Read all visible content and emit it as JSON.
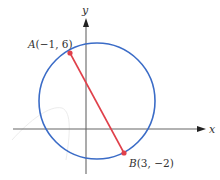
{
  "diagram": {
    "type": "coordinate-geometry",
    "axes": {
      "x_label": "x",
      "y_label": "y",
      "color": "#555555"
    },
    "circle": {
      "color": "#3b6cc7",
      "diameter_endpoints": [
        "A",
        "B"
      ]
    },
    "segment": {
      "from": "A",
      "to": "B",
      "color": "#e0404a"
    },
    "points": [
      {
        "name": "A",
        "x": -1,
        "y": 6,
        "label": "A(−1, 6)",
        "color": "#e0404a"
      },
      {
        "name": "B",
        "x": 3,
        "y": -2,
        "label": "B(3, −2)",
        "color": "#e0404a"
      }
    ]
  },
  "labels": {
    "x_axis": "x",
    "y_axis": "y",
    "point_a_letter": "A",
    "point_a_coords": "(−1, 6)",
    "point_b_letter": "B",
    "point_b_coords": "(3, −2)"
  }
}
